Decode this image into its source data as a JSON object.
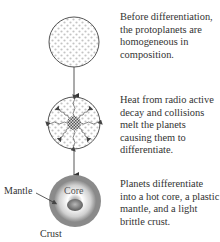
{
  "stages": [
    {
      "caption": "Before differentiation, the protoplanets are homogeneous in composition.",
      "icon": "homogeneous-protoplanet"
    },
    {
      "caption": "Heat from radio active decay and collisions melt the planets causing them to differentiate.",
      "icon": "heating-protoplanet"
    },
    {
      "caption": "Planets differentiate into a hot core, a plastic mantle, and a light brittle crust.",
      "icon": "differentiated-planet"
    }
  ],
  "labels": {
    "core": "Core",
    "mantle": "Mantle",
    "crust": "Crust"
  },
  "colors": {
    "outline": "#555555",
    "dots": "#c8c8c8",
    "crust": "#8a8a8a",
    "mantle_light": "#f2f2f2",
    "core": "#7a7a7a"
  }
}
